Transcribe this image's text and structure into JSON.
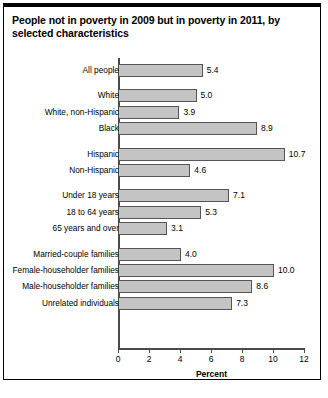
{
  "figure": {
    "title": "People not in poverty in 2009 but in poverty in 2011, by selected characteristics",
    "border_color": "#000000",
    "background": "#ffffff"
  },
  "chart_data": {
    "type": "bar",
    "orientation": "horizontal",
    "title": "People not in poverty in 2009 but in poverty in 2011, by selected characteristics",
    "xlabel": "Percent",
    "ylabel": "",
    "xlim": [
      0,
      12
    ],
    "xticks": [
      0,
      2,
      4,
      6,
      8,
      10,
      12
    ],
    "xtick_labels": [
      "0",
      "2",
      "4",
      "6",
      "8",
      "10",
      "12"
    ],
    "grid": false,
    "legend": null,
    "bar_color": "#c4c4c4",
    "bar_edge_color": "#555555",
    "categories": [
      "All people",
      "White",
      "White, non-Hispanic",
      "Black",
      "Hispanic",
      "Non-Hispanic",
      "Under 18 years",
      "18 to 64 years",
      "65 years and over",
      "Married-couple families",
      "Female-householder families",
      "Male-householder families",
      "Unrelated individuals"
    ],
    "values": [
      5.4,
      5.0,
      3.9,
      8.9,
      10.7,
      4.6,
      7.1,
      5.3,
      3.1,
      4.0,
      10.0,
      8.6,
      7.3
    ],
    "value_labels": [
      "5.4",
      "5.0",
      "3.9",
      "8.9",
      "10.7",
      "4.6",
      "7.1",
      "5.3",
      "3.1",
      "4.0",
      "10.0",
      "8.6",
      "7.3"
    ],
    "groups": [
      {
        "name": "total",
        "categories": [
          "All people"
        ]
      },
      {
        "name": "race",
        "categories": [
          "White",
          "White, non-Hispanic",
          "Black"
        ]
      },
      {
        "name": "ethnicity",
        "categories": [
          "Hispanic",
          "Non-Hispanic"
        ]
      },
      {
        "name": "age",
        "categories": [
          "Under 18 years",
          "18 to 64 years",
          "65 years and over"
        ]
      },
      {
        "name": "family-type",
        "categories": [
          "Married-couple families",
          "Female-householder families",
          "Male-householder families",
          "Unrelated individuals"
        ]
      }
    ]
  }
}
